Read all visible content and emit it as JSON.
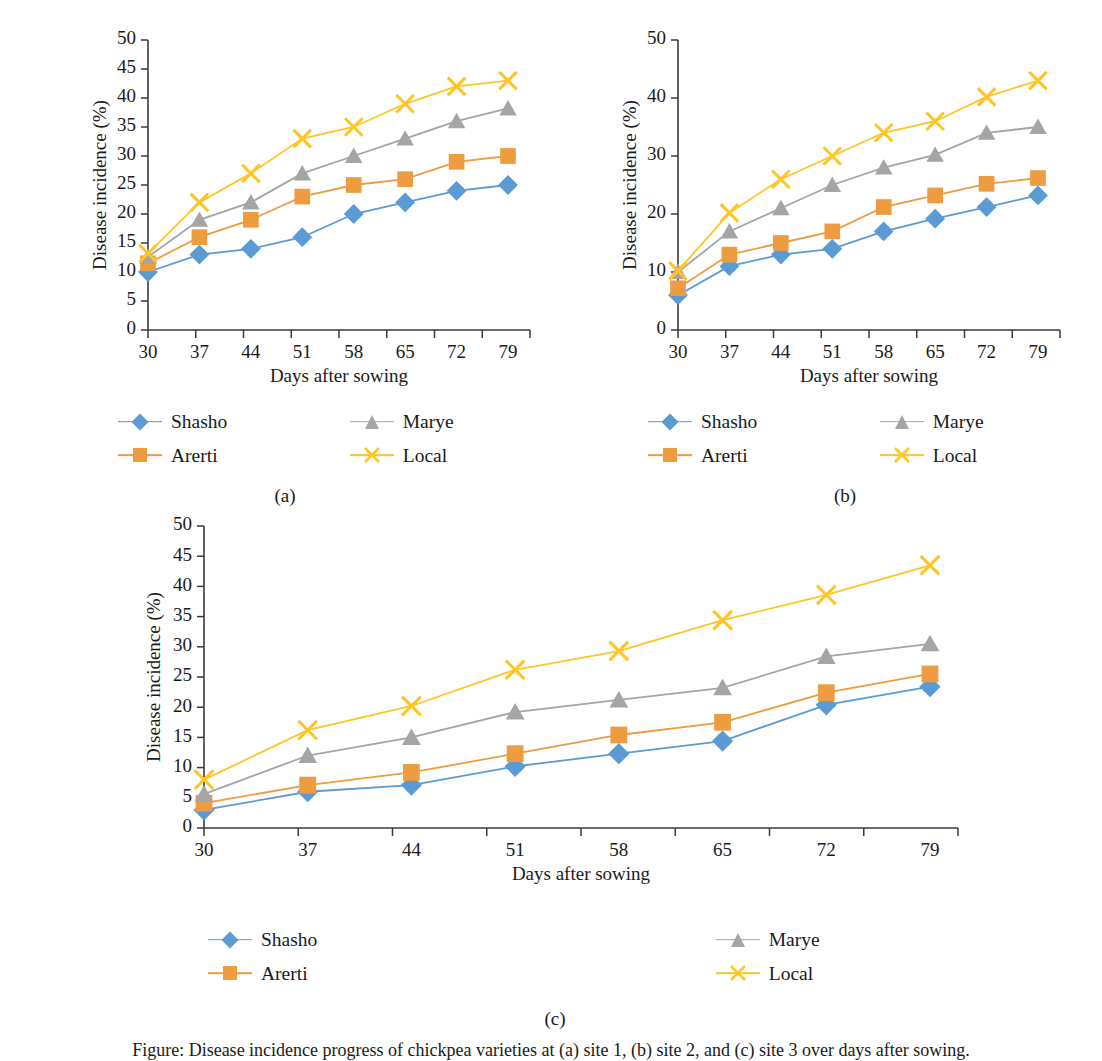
{
  "figure": {
    "caption": "Figure: Disease incidence progress of chickpea varieties at (a) site 1, (b) site 2, and (c) site 3 over days after sowing.",
    "panel_captions": {
      "a": "(a)",
      "b": "(b)",
      "c": "(c)"
    }
  },
  "series_style": {
    "Shasho": {
      "color": "#5B9BD5",
      "marker": "diamond"
    },
    "Arerti": {
      "color": "#ED9C3F",
      "marker": "square"
    },
    "Marye": {
      "color": "#A5A5A5",
      "marker": "triangle"
    },
    "Local": {
      "color": "#FFC524",
      "marker": "cross"
    }
  },
  "legend": {
    "items": [
      {
        "label": "Shasho",
        "marker": "diamond-marker-icon",
        "color": "#5B9BD5"
      },
      {
        "label": "Marye",
        "marker": "triangle-marker-icon",
        "color": "#A5A5A5"
      },
      {
        "label": "Arerti",
        "marker": "square-marker-icon",
        "color": "#ED9C3F"
      },
      {
        "label": "Local",
        "marker": "cross-marker-icon",
        "color": "#FFC524"
      }
    ]
  },
  "chart_data": [
    {
      "id": "a",
      "type": "line",
      "title": "",
      "xlabel": "Days after sowing",
      "ylabel": "Disease incidence (%)",
      "categories": [
        30,
        37,
        44,
        51,
        58,
        65,
        72,
        79
      ],
      "xticklabels": [
        "30",
        "37",
        "44",
        "51",
        "58",
        "65",
        "72",
        "79"
      ],
      "ylim": [
        0,
        50
      ],
      "yticks": [
        0,
        5,
        10,
        15,
        20,
        25,
        30,
        35,
        40,
        45,
        50
      ],
      "yticklabels": [
        "0",
        "5",
        "10",
        "15",
        "20",
        "25",
        "30",
        "35",
        "40",
        "45",
        "50"
      ],
      "grid": false,
      "legend_position": "below",
      "series": [
        {
          "name": "Shasho",
          "values": [
            10.0,
            13.0,
            14.0,
            16.0,
            20.0,
            22.0,
            24.0,
            25.0
          ]
        },
        {
          "name": "Arerti",
          "values": [
            11.5,
            16.0,
            19.0,
            23.0,
            25.0,
            26.0,
            29.0,
            30.0
          ]
        },
        {
          "name": "Marye",
          "values": [
            12.6,
            19.0,
            22.0,
            27.0,
            30.0,
            33.0,
            36.0,
            38.2
          ]
        },
        {
          "name": "Local",
          "values": [
            13.2,
            22.0,
            27.0,
            33.0,
            35.0,
            39.0,
            42.0,
            43.0
          ]
        }
      ]
    },
    {
      "id": "b",
      "type": "line",
      "title": "",
      "xlabel": "Days after sowing",
      "ylabel": "Disease incidence (%)",
      "categories": [
        30,
        37,
        44,
        51,
        58,
        65,
        72,
        79
      ],
      "xticklabels": [
        "30",
        "37",
        "44",
        "51",
        "58",
        "65",
        "72",
        "79"
      ],
      "ylim": [
        0,
        50
      ],
      "yticks": [
        0,
        10,
        20,
        30,
        40,
        50
      ],
      "yticklabels": [
        "0",
        "10",
        "20",
        "30",
        "40",
        "50"
      ],
      "grid": false,
      "legend_position": "below",
      "series": [
        {
          "name": "Shasho",
          "values": [
            6.0,
            11.0,
            13.0,
            14.0,
            17.0,
            19.2,
            21.2,
            23.2
          ]
        },
        {
          "name": "Arerti",
          "values": [
            7.2,
            13.0,
            15.0,
            17.0,
            21.2,
            23.2,
            25.2,
            26.2
          ]
        },
        {
          "name": "Marye",
          "values": [
            10.0,
            17.0,
            21.0,
            25.0,
            28.0,
            30.2,
            34.0,
            35.0
          ]
        },
        {
          "name": "Local",
          "values": [
            10.2,
            20.2,
            26.0,
            30.0,
            34.0,
            36.0,
            40.2,
            43.0
          ]
        }
      ]
    },
    {
      "id": "c",
      "type": "line",
      "title": "",
      "xlabel": "Days after sowing",
      "ylabel": "Disease incidence (%)",
      "categories": [
        30,
        37,
        44,
        51,
        58,
        65,
        72,
        79
      ],
      "xticklabels": [
        "30",
        "37",
        "44",
        "51",
        "58",
        "65",
        "72",
        "79"
      ],
      "ylim": [
        0,
        50
      ],
      "yticks": [
        0,
        5,
        10,
        15,
        20,
        25,
        30,
        35,
        40,
        45,
        50
      ],
      "yticklabels": [
        "0",
        "5",
        "10",
        "15",
        "20",
        "25",
        "30",
        "35",
        "40",
        "45",
        "50"
      ],
      "grid": false,
      "legend_position": "below",
      "series": [
        {
          "name": "Shasho",
          "values": [
            3.0,
            6.0,
            7.1,
            10.2,
            12.3,
            14.4,
            20.4,
            23.4
          ]
        },
        {
          "name": "Arerti",
          "values": [
            4.1,
            7.1,
            9.2,
            12.3,
            15.4,
            17.5,
            22.4,
            25.5
          ]
        },
        {
          "name": "Marye",
          "values": [
            5.6,
            12.0,
            15.0,
            19.2,
            21.2,
            23.2,
            28.4,
            30.5
          ]
        },
        {
          "name": "Local",
          "values": [
            8.0,
            16.2,
            20.2,
            26.2,
            29.3,
            34.4,
            38.6,
            43.5
          ]
        }
      ]
    }
  ]
}
